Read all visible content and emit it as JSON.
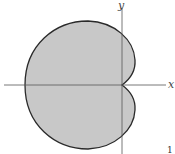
{
  "diagram": {
    "type": "polar-curve",
    "shape": "cardioid",
    "axes": {
      "x_label": "x",
      "y_label": "y"
    },
    "corner_mark": "1",
    "colors": {
      "fill": "#c8c8c8",
      "stroke": "#2a2a2a",
      "axis": "#555555",
      "background": "#ffffff"
    }
  }
}
